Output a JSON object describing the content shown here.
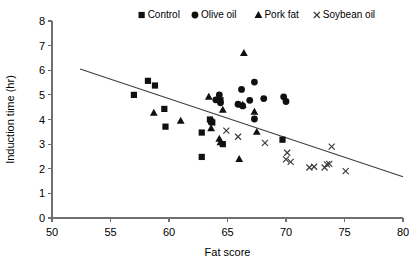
{
  "chart_data": {
    "type": "scatter",
    "title": "",
    "xlabel": "Fat score",
    "ylabel": "Induction time (hr)",
    "xlim": [
      50,
      80
    ],
    "ylim": [
      0,
      8
    ],
    "xticks": [
      50,
      55,
      60,
      65,
      70,
      75,
      80
    ],
    "yticks": [
      0,
      1,
      2,
      3,
      4,
      5,
      6,
      7,
      8
    ],
    "grid": false,
    "legend_position": "top",
    "legend": [
      "Control",
      "Olive oil",
      "Pork fat",
      "Soybean oil"
    ],
    "trendline": {
      "x": [
        52.4,
        80.0
      ],
      "y": [
        6.05,
        1.68
      ]
    },
    "series": [
      {
        "name": "Control",
        "marker": "square",
        "points": [
          [
            57.0,
            5.0
          ],
          [
            58.2,
            5.57
          ],
          [
            58.8,
            5.38
          ],
          [
            59.6,
            4.43
          ],
          [
            59.7,
            3.71
          ],
          [
            62.8,
            3.47
          ],
          [
            62.8,
            2.48
          ],
          [
            63.5,
            4.0
          ],
          [
            63.6,
            3.92
          ],
          [
            63.7,
            3.88
          ],
          [
            64.4,
            4.78
          ],
          [
            64.6,
            3.0
          ],
          [
            69.7,
            3.18
          ]
        ]
      },
      {
        "name": "Olive oil",
        "marker": "circle",
        "points": [
          [
            64.0,
            4.8
          ],
          [
            64.3,
            5.0
          ],
          [
            64.4,
            4.68
          ],
          [
            65.9,
            4.62
          ],
          [
            66.2,
            5.22
          ],
          [
            66.3,
            4.55
          ],
          [
            66.9,
            4.78
          ],
          [
            67.3,
            5.52
          ],
          [
            67.3,
            4.02
          ],
          [
            68.1,
            4.85
          ],
          [
            69.8,
            4.92
          ],
          [
            70.0,
            4.73
          ]
        ]
      },
      {
        "name": "Pork fat",
        "marker": "triangle",
        "points": [
          [
            58.7,
            4.28
          ],
          [
            61.0,
            3.95
          ],
          [
            63.4,
            4.93
          ],
          [
            63.6,
            3.65
          ],
          [
            64.3,
            3.22
          ],
          [
            64.4,
            3.08
          ],
          [
            64.6,
            4.4
          ],
          [
            66.0,
            2.4
          ],
          [
            66.4,
            6.7
          ],
          [
            66.3,
            4.6
          ],
          [
            67.3,
            4.32
          ],
          [
            67.5,
            3.5
          ]
        ]
      },
      {
        "name": "Soybean oil",
        "marker": "cross",
        "points": [
          [
            64.9,
            3.55
          ],
          [
            65.9,
            3.3
          ],
          [
            68.2,
            3.05
          ],
          [
            70.1,
            2.65
          ],
          [
            70.0,
            2.38
          ],
          [
            70.4,
            2.28
          ],
          [
            72.0,
            2.05
          ],
          [
            72.4,
            2.08
          ],
          [
            73.3,
            2.05
          ],
          [
            73.5,
            2.18
          ],
          [
            73.7,
            2.2
          ],
          [
            73.9,
            2.9
          ],
          [
            75.1,
            1.9
          ]
        ]
      }
    ]
  }
}
